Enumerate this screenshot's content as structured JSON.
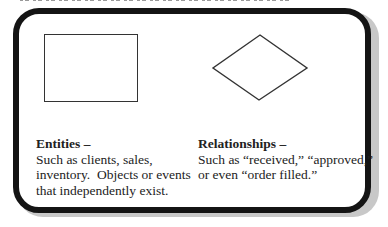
{
  "diagram": {
    "shapes": [
      {
        "type": "rectangle",
        "meaning": "entity"
      },
      {
        "type": "diamond",
        "meaning": "relationship"
      }
    ],
    "entities": {
      "title": "Entities –",
      "lines": [
        "Such as clients, sales,",
        "inventory.  Objects or events",
        "that independently exist."
      ]
    },
    "relationships": {
      "title": "Relationships –",
      "lines": [
        "Such as “received,” “approved,”",
        "or even “order filled.”"
      ]
    },
    "colors": {
      "border": "#141414",
      "shadow": "#c8c8c8",
      "background": "#ffffff"
    }
  }
}
